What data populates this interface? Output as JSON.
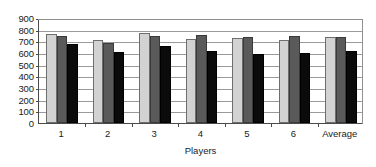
{
  "chart_data": {
    "type": "bar",
    "title": "",
    "xlabel": "Players",
    "ylabel": "",
    "categories": [
      "1",
      "2",
      "3",
      "4",
      "5",
      "6",
      "Average"
    ],
    "series": [
      {
        "name": "series-1",
        "color": "#d2d2d2",
        "values": [
          765,
          710,
          770,
          720,
          725,
          715,
          735
        ]
      },
      {
        "name": "series-2",
        "color": "#5a5a5a",
        "values": [
          745,
          690,
          750,
          755,
          735,
          745,
          735
        ]
      },
      {
        "name": "series-3",
        "color": "#0b0b0b",
        "values": [
          680,
          610,
          660,
          615,
          590,
          600,
          620
        ]
      }
    ],
    "ylim": [
      0,
      900
    ],
    "ytick_labels": [
      "900",
      "800",
      "700",
      "600",
      "500",
      "400",
      "300",
      "200",
      "100",
      "0"
    ],
    "ytick_values": [
      900,
      800,
      700,
      600,
      500,
      400,
      300,
      200,
      100,
      0
    ],
    "grid": true,
    "legend": "none"
  }
}
